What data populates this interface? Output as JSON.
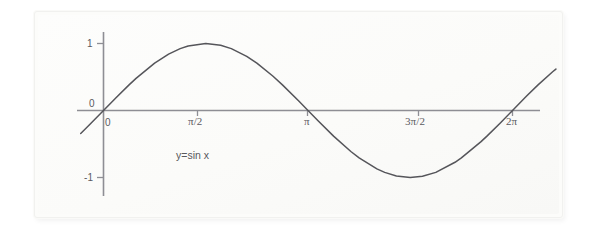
{
  "figure": {
    "background_color": "#ffffff",
    "panel_color": "#fcfcfa",
    "axis_color": "#8a8a90",
    "curve_color": "#55555a",
    "text_color": "#5a5a5f"
  },
  "annotation": {
    "equation_label": "y=sin x"
  },
  "chart_data": {
    "type": "line",
    "title": "",
    "subtitle": "",
    "xlabel": "",
    "ylabel": "",
    "grid": false,
    "legend": null,
    "annotations": [
      {
        "text": "y=sin x",
        "x": 0.95,
        "y": -0.65
      }
    ],
    "xlim": [
      -0.35,
      6.95
    ],
    "ylim": [
      -1.45,
      1.48
    ],
    "xticks": [
      0,
      1.5707963,
      3.1415927,
      4.712389,
      6.2831853
    ],
    "xticklabels": [
      "0",
      "π/2",
      "π",
      "3π/2",
      "2π"
    ],
    "yticks": [
      1,
      0,
      -1
    ],
    "yticklabels": [
      "1",
      "0",
      "-1"
    ],
    "series": [
      {
        "name": "y = sin x",
        "expression": "y=sin x",
        "x": [
          -0.35,
          -0.2,
          0,
          0.2,
          0.3926991,
          0.5,
          0.7853982,
          1.0,
          1.1780972,
          1.3,
          1.5707963,
          1.8,
          1.9634954,
          2.2,
          2.3561945,
          2.6,
          2.7488936,
          3.0,
          3.1415927,
          3.3,
          3.5342917,
          3.8,
          3.9269908,
          4.2,
          4.3196899,
          4.5,
          4.712389,
          4.9,
          5.1050881,
          5.4,
          5.4977871,
          5.8,
          5.8904862,
          6.1,
          6.2831853,
          6.5,
          6.6758623,
          6.9,
          6.95
        ],
        "y": [
          -0.3429,
          -0.1987,
          0.0,
          0.1987,
          0.3827,
          0.4794,
          0.7071,
          0.8415,
          0.9239,
          0.9636,
          1.0,
          0.9738,
          0.9239,
          0.8085,
          0.7071,
          0.5155,
          0.3827,
          0.1411,
          0.0,
          -0.1577,
          -0.3827,
          -0.6119,
          -0.7071,
          -0.8716,
          -0.9239,
          -0.9775,
          -1.0,
          -0.9825,
          -0.9239,
          -0.7728,
          -0.7071,
          -0.4646,
          -0.3827,
          -0.1823,
          0.0,
          0.2151,
          0.3827,
          0.5784,
          0.6183
        ]
      }
    ],
    "axis_style": {
      "spines": "centered-cross",
      "x_axis_at_y": 0,
      "y_axis_at_x": 0,
      "tick_direction": "out"
    }
  }
}
